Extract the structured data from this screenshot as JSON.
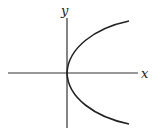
{
  "diagram": {
    "type": "parabola-graph",
    "axes": {
      "x_label": "x",
      "y_label": "y"
    },
    "colors": {
      "background": "#ffffff",
      "stroke": "#222222"
    }
  }
}
